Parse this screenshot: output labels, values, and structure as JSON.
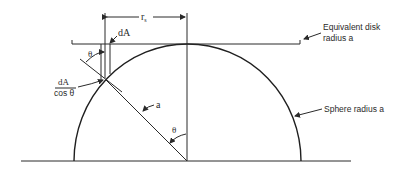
{
  "diagram": {
    "labels": {
      "rs": "r",
      "rs_sub": "s",
      "dA": "dA",
      "theta_top": "θ",
      "dA_over_cos_num": "dA",
      "dA_over_cos_den": "cos θ",
      "a": "a",
      "theta_center": "θ",
      "disk_line1": "Equivalent disk",
      "disk_line2": "radius a",
      "sphere": "Sphere radius a"
    }
  }
}
